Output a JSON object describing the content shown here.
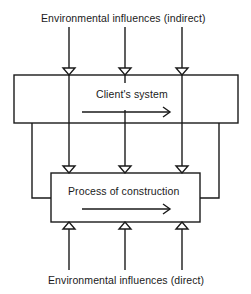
{
  "diagram": {
    "top_label": "Environmental influences (indirect)",
    "bottom_label": "Environmental influences (direct)",
    "upper_box": {
      "label": "Client's system"
    },
    "lower_box": {
      "label": "Process of construction"
    },
    "colors": {
      "line": "#1a1a1a",
      "background": "#ffffff"
    }
  }
}
